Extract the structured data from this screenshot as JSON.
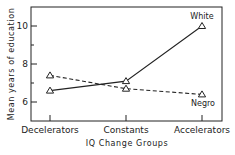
{
  "chart_data": {
    "type": "line",
    "title": "",
    "xlabel": "IQ Change Groups",
    "ylabel": "Mean years of education",
    "categories": [
      "Decelerators",
      "Constants",
      "Accelerators"
    ],
    "ylim": [
      5.0,
      11.0
    ],
    "yticks_major": [
      6,
      8,
      10
    ],
    "yticks_minor": [
      7,
      9
    ],
    "ytick_labels": [
      "6",
      "8",
      "10"
    ],
    "grid": false,
    "legend": "inline labels at line ends",
    "series": [
      {
        "name": "White",
        "values": [
          6.6,
          7.1,
          10.0
        ],
        "style": "solid",
        "marker": "open-triangle"
      },
      {
        "name": "Negro",
        "values": [
          7.4,
          6.7,
          6.4
        ],
        "style": "dashed",
        "marker": "open-triangle"
      }
    ]
  }
}
